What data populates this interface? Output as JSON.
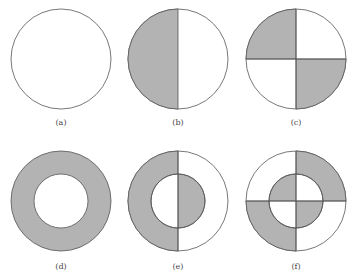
{
  "figure": {
    "colors": {
      "fill": "#b3b3b3",
      "stroke": "#555555",
      "background": "#ffffff"
    },
    "panels": [
      {
        "id": "a",
        "label": "(a)",
        "description": "empty circle"
      },
      {
        "id": "b",
        "label": "(b)",
        "description": "circle with left half shaded"
      },
      {
        "id": "c",
        "label": "(c)",
        "description": "circle with top-left and bottom-right quadrants shaded"
      },
      {
        "id": "d",
        "label": "(d)",
        "description": "shaded annulus (ring)"
      },
      {
        "id": "e",
        "label": "(e)",
        "description": "annulus left half shaded, inner disk right half shaded"
      },
      {
        "id": "f",
        "label": "(f)",
        "description": "annulus top-right and bottom-left quadrants shaded, inner disk top-left and bottom-right quadrants shaded"
      }
    ]
  }
}
